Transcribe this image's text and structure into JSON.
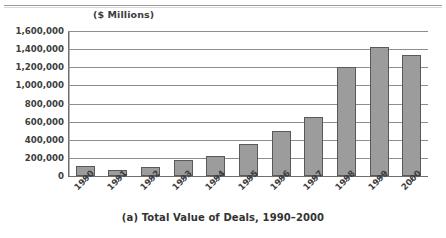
{
  "figure": {
    "unit_label": "($ Millions)",
    "caption": "(a) Total Value of Deals, 1990–2000",
    "top_rule": true
  },
  "colors": {
    "bar_fill": "#9c9c9c",
    "bar_border": "#595959",
    "gridline": "#8d8d8d",
    "axis": "#6e6e6e",
    "text": "#3d3d3d",
    "background": "#ffffff"
  },
  "chart_data": {
    "type": "bar",
    "title": "(a) Total Value of Deals, 1990–2000",
    "subtitle": "($ Millions)",
    "xlabel": "",
    "ylabel": "($ Millions)",
    "categories": [
      "1990",
      "1991",
      "1992",
      "1993",
      "1994",
      "1995",
      "1996",
      "1997",
      "1998",
      "1999",
      "2000"
    ],
    "values": [
      110000,
      70000,
      95000,
      180000,
      225000,
      355000,
      495000,
      650000,
      1200000,
      1425000,
      1335000
    ],
    "ylim": [
      0,
      1600000
    ],
    "ytick_values": [
      0,
      200000,
      400000,
      600000,
      800000,
      1000000,
      1200000,
      1400000,
      1600000
    ],
    "ytick_labels": [
      "0",
      "200,000",
      "400,000",
      "600,000",
      "800,000",
      "1,000,000",
      "1,200,000",
      "1,400,000",
      "1,600,000"
    ],
    "grid": true,
    "grid_axis": "y",
    "legend": false,
    "legend_position": "none",
    "xtick_rotation": -45,
    "series": [
      {
        "name": "Total Value of Deals",
        "values": [
          110000,
          70000,
          95000,
          180000,
          225000,
          355000,
          495000,
          650000,
          1200000,
          1425000,
          1335000
        ]
      }
    ]
  }
}
